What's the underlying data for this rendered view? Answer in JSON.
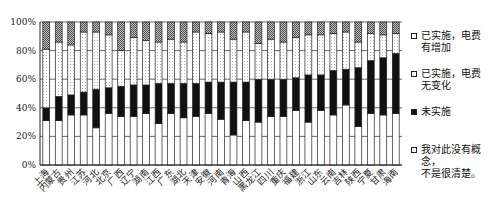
{
  "chart_data": {
    "type": "bar",
    "stacked": true,
    "title": "",
    "xlabel": "",
    "ylabel": "",
    "ylim": [
      0,
      100
    ],
    "yticks": [
      "0%",
      "20%",
      "40%",
      "60%",
      "80%",
      "100%"
    ],
    "grid": true,
    "legend_position": "right",
    "categories": [
      "上海",
      "内蒙古",
      "贵州",
      "江苏",
      "河北",
      "北京",
      "广西",
      "辽宁",
      "湖南",
      "江西",
      "广东",
      "湖北",
      "天津",
      "安徽",
      "河南",
      "青海",
      "山西",
      "黑龙江",
      "四川",
      "重庆",
      "福建",
      "浙江",
      "山东",
      "云南",
      "吉林",
      "陕西",
      "宁夏",
      "甘肃",
      "海南"
    ],
    "series": [
      {
        "name": "我对此没有概念，不是很清楚。",
        "pattern": "white",
        "values": [
          31,
          31,
          35,
          35,
          26,
          36,
          34,
          34,
          36,
          29,
          36,
          33,
          34,
          36,
          32,
          21,
          31,
          30,
          34,
          34,
          38,
          30,
          38,
          35,
          42,
          27,
          36,
          35,
          36
        ]
      },
      {
        "name": "未实施",
        "pattern": "black",
        "values": [
          9,
          17,
          14,
          16,
          27,
          18,
          21,
          22,
          20,
          28,
          21,
          24,
          23,
          22,
          26,
          37,
          27,
          30,
          26,
          26,
          23,
          33,
          25,
          31,
          25,
          41,
          37,
          40,
          42
        ]
      },
      {
        "name": "已实施，电费无变化",
        "pattern": "dotted",
        "values": [
          41,
          38,
          35,
          42,
          40,
          37,
          25,
          33,
          31,
          29,
          31,
          29,
          36,
          34,
          35,
          30,
          35,
          25,
          28,
          26,
          28,
          28,
          28,
          26,
          26,
          18,
          19,
          16,
          14
        ]
      },
      {
        "name": "已实施，电费有增加",
        "pattern": "hatched",
        "values": [
          19,
          14,
          16,
          7,
          7,
          9,
          20,
          11,
          13,
          14,
          12,
          14,
          7,
          8,
          7,
          12,
          7,
          15,
          12,
          14,
          11,
          9,
          9,
          8,
          7,
          14,
          8,
          9,
          8
        ]
      }
    ]
  },
  "legend": {
    "items": [
      {
        "label_line1": "已实施，电费",
        "label_line2": "有增加"
      },
      {
        "label_line1": "已实施，电费",
        "label_line2": "无变化"
      },
      {
        "label_line1": "未实施",
        "label_line2": ""
      },
      {
        "label_line1": "我对此没有概念，",
        "label_line2": "不是很清楚。"
      }
    ]
  }
}
